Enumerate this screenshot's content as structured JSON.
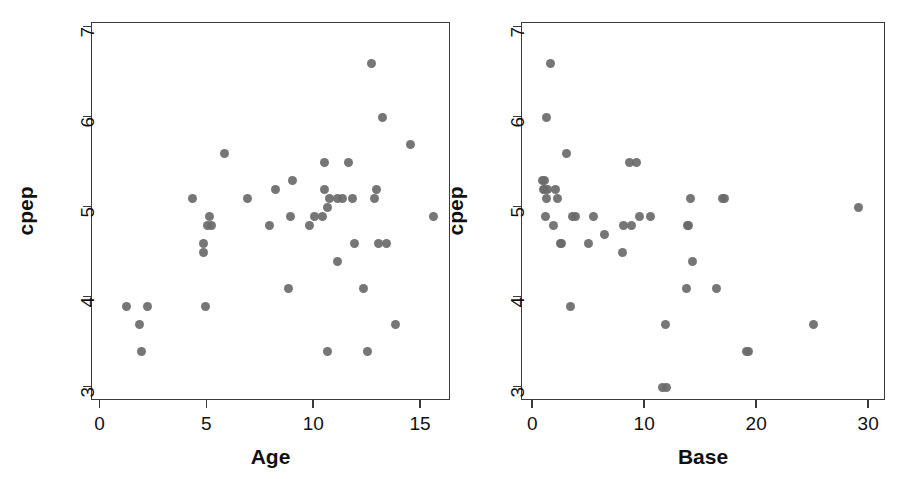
{
  "figure": {
    "background": "#ffffff",
    "marker_color": "#6a6a6a",
    "axis_color": "#3a3a3a",
    "text_color": "#111111",
    "panel_count": 2
  },
  "chart_data": [
    {
      "type": "scatter",
      "title": "",
      "xlabel": "Age",
      "ylabel": "cpep",
      "xlim": [
        -0.4,
        16.4
      ],
      "ylim": [
        2.85,
        7.05
      ],
      "xticks": [
        0,
        5,
        10,
        15
      ],
      "xticklabels": [
        "0",
        "5",
        "10",
        "15"
      ],
      "yticks": [
        3,
        4,
        5,
        6,
        7
      ],
      "yticklabels": [
        "3",
        "4",
        "5",
        "6",
        "7"
      ],
      "grid": false,
      "legend": false,
      "marker": "filled-circle",
      "n_points": 43,
      "x": [
        5.2,
        8.8,
        10.5,
        10.6,
        10.4,
        1.8,
        12.7,
        15.6,
        5.8,
        1.9,
        8.2,
        4.8,
        7.9,
        11.8,
        10.5,
        10.6,
        10.7,
        11.1,
        11.3,
        12.9,
        13.2,
        14.5,
        9.8,
        10.0,
        12.3,
        8.9,
        12.5,
        13.0,
        13.8,
        4.9,
        11.1,
        5.1,
        4.8,
        5.0,
        2.2,
        1.2,
        9.0,
        11.6,
        11.9,
        13.4,
        12.8,
        4.3,
        6.9
      ],
      "y": [
        4.8,
        4.1,
        5.2,
        3.4,
        4.9,
        3.7,
        6.6,
        4.9,
        5.6,
        3.4,
        5.2,
        4.5,
        4.8,
        5.1,
        5.5,
        5.0,
        5.1,
        5.1,
        5.1,
        5.2,
        6.0,
        5.7,
        4.8,
        4.9,
        4.1,
        4.9,
        3.4,
        4.6,
        3.7,
        3.9,
        4.4,
        4.9,
        4.6,
        4.8,
        3.9,
        3.9,
        5.3,
        5.5,
        4.6,
        4.6,
        5.1,
        5.1,
        5.1
      ]
    },
    {
      "type": "scatter",
      "title": "",
      "xlabel": "Base",
      "ylabel": "cpep",
      "xlim": [
        -1.0,
        31.5
      ],
      "ylim": [
        2.85,
        7.05
      ],
      "xticks": [
        0,
        10,
        20,
        30
      ],
      "xticklabels": [
        "0",
        "10",
        "20",
        "30"
      ],
      "yticks": [
        3,
        4,
        5,
        6,
        7
      ],
      "yticklabels": [
        "3",
        "4",
        "5",
        "6",
        "7"
      ],
      "grid": false,
      "legend": false,
      "marker": "filled-circle",
      "n_points": 43,
      "x": [
        8.8,
        13.8,
        1.5,
        19.0,
        1.2,
        29.0,
        3.0,
        11.5,
        2.0,
        1.0,
        3.5,
        1.0,
        14.0,
        2.2,
        1.3,
        1.2,
        1.8,
        2.4,
        3.8,
        1.1,
        0.9,
        0.8,
        8.0,
        9.5,
        10.5,
        8.1,
        19.2,
        14.2,
        16.4,
        3.3,
        13.7,
        4.9,
        5.4,
        6.4,
        11.8,
        11.9,
        9.2,
        8.6,
        16.9,
        13.9,
        17.1,
        2.5,
        25.0
      ],
      "y": [
        4.8,
        4.8,
        6.6,
        3.4,
        6.0,
        5.0,
        5.6,
        3.0,
        5.2,
        5.3,
        4.9,
        5.2,
        5.1,
        5.1,
        5.2,
        5.1,
        4.8,
        4.6,
        4.9,
        4.9,
        5.2,
        5.3,
        4.5,
        4.9,
        4.9,
        4.8,
        3.4,
        4.4,
        4.1,
        3.9,
        4.1,
        4.6,
        4.9,
        4.7,
        3.7,
        3.0,
        5.5,
        5.5,
        5.1,
        4.8,
        5.1,
        4.6,
        3.7
      ]
    }
  ],
  "panels": [
    {
      "name": "age-panel",
      "xlabel": "Age",
      "ylabel": "cpep",
      "xticklabels": [
        "0",
        "5",
        "10",
        "15"
      ],
      "yticklabels": [
        "3",
        "4",
        "5",
        "6",
        "7"
      ]
    },
    {
      "name": "base-panel",
      "xlabel": "Base",
      "ylabel": "cpep",
      "xticklabels": [
        "0",
        "10",
        "20",
        "30"
      ],
      "yticklabels": [
        "3",
        "4",
        "5",
        "6",
        "7"
      ]
    }
  ]
}
